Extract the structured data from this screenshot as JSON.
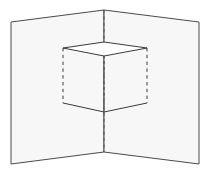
{
  "figure": {
    "background_color": "#ffffff",
    "panel_fill": "#f7f7f7",
    "panel_stroke": "#4a4a4a",
    "cube_stroke": "#3a3a3a",
    "dash_stroke": "#555555",
    "caption_text": "",
    "parts": [
      {
        "name": "left-panel",
        "label": "Left panel",
        "kind": "quad",
        "fill": "#f7f7f7",
        "stroke": "#4a4a4a"
      },
      {
        "name": "right-panel",
        "label": "Right panel",
        "kind": "quad",
        "fill": "#f7f7f7",
        "stroke": "#4a4a4a"
      },
      {
        "name": "fold-line",
        "label": "Center fold line",
        "kind": "dashed-line",
        "stroke": "#555555"
      },
      {
        "name": "cube-top-face",
        "label": "Cube top face",
        "kind": "quad",
        "fill": "#ffffff",
        "stroke": "#3a3a3a"
      },
      {
        "name": "cube-bottom-edges",
        "label": "Cube bottom edges",
        "kind": "polyline",
        "stroke": "#3a3a3a"
      },
      {
        "name": "cube-left-vertical-edge",
        "label": "Cube left vertical edge",
        "kind": "dashed-line",
        "stroke": "#3a3a3a"
      },
      {
        "name": "cube-right-vertical-edge",
        "label": "Cube right vertical edge",
        "kind": "dashed-line",
        "stroke": "#3a3a3a"
      },
      {
        "name": "cube-center-vertical-edge",
        "label": "Cube center vertical edge",
        "kind": "dashed-line",
        "stroke": "#555555"
      }
    ],
    "geometry": {
      "left_panel_points": "11,22 104,10 104,152 11,164",
      "right_panel_points": "104,10 199,22 199,164 104,152",
      "fold_top": {
        "x": 104,
        "y": 10
      },
      "fold_bottom": {
        "x": 104,
        "y": 152
      },
      "cube_top_face_points": "63,48 104,42 147,48 104,56",
      "cube_bottom_points": "63,103 104,112 147,103",
      "cube_left_top": {
        "x": 63,
        "y": 48
      },
      "cube_left_bottom": {
        "x": 63,
        "y": 103
      },
      "cube_right_top": {
        "x": 147,
        "y": 48
      },
      "cube_right_bottom": {
        "x": 147,
        "y": 103
      },
      "cube_center_top": {
        "x": 104,
        "y": 56
      },
      "cube_center_bottom": {
        "x": 104,
        "y": 112
      }
    }
  }
}
